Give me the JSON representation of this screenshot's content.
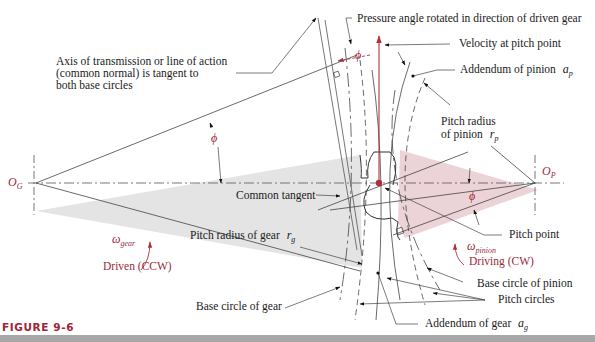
{
  "figure": {
    "caption": "FIGURE 9-6",
    "colors": {
      "gear_fill": "#e4e4e4",
      "pinion_fill": "#ecd3d7",
      "accent_red": "#9b2a3a",
      "line": "#333333",
      "caption": "#a0233a",
      "rule": "#a8a8a8"
    }
  },
  "labels": {
    "axis_of_transmission": [
      "Axis of transmission or line of action",
      "(common normal) is tangent to",
      "both base circles"
    ],
    "pressure_angle": "Pressure angle rotated in direction of driven gear",
    "velocity_pitch_point": "Velocity at pitch point",
    "addendum_pinion": "Addendum of pinion",
    "addendum_pinion_sym": "a",
    "addendum_pinion_sub": "p",
    "pitch_radius_pinion_line1": "Pitch radius",
    "pitch_radius_pinion_line2": "of pinion",
    "pitch_radius_pinion_sym": "r",
    "pitch_radius_pinion_sub": "p",
    "common_tangent": "Common tangent",
    "pitch_radius_gear": "Pitch radius of gear",
    "pitch_radius_gear_sym": "r",
    "pitch_radius_gear_sub": "g",
    "pitch_point": "Pitch point",
    "base_circle_pinion": "Base circle of pinion",
    "pitch_circles": "Pitch circles",
    "base_circle_gear": "Base circle of gear",
    "addendum_gear": "Addendum of gear",
    "addendum_gear_sym": "a",
    "addendum_gear_sub": "g",
    "phi": "ϕ",
    "og_sym": "O",
    "og_sub": "G",
    "op_sym": "O",
    "op_sub": "P",
    "omega": "ω",
    "omega_gear_sub": "gear",
    "omega_pinion_sub": "pinion",
    "driven": "Driven (CCW)",
    "driving": "Driving (CW)"
  }
}
